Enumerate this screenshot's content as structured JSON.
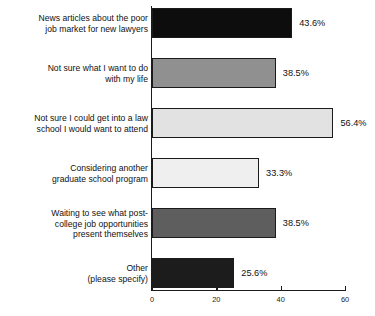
{
  "chart_data": {
    "type": "bar",
    "orientation": "horizontal",
    "title": "",
    "subtitle": "",
    "xlabel": "",
    "ylabel": "",
    "xlim": [
      0,
      60
    ],
    "xticks": [
      0,
      20,
      40,
      60
    ],
    "xtick_labels": [
      "0",
      "20",
      "40",
      "60"
    ],
    "grid": false,
    "legend": false,
    "value_label_suffix": "%",
    "categories": [
      "News articles about the poor job market for new lawyers",
      "Not sure what I want to do with my life",
      "Not sure I could get into a law school I would want to attend",
      "Considering another graduate school program",
      "Waiting to see what post-college job opportunities present themselves",
      "Other (please specify)"
    ],
    "values": [
      43.6,
      38.5,
      56.4,
      33.3,
      38.5,
      25.6
    ],
    "bars": [
      {
        "label_lines": [
          "News articles about the poor",
          "job market for new lawyers"
        ],
        "value": 43.6,
        "value_label": "43.6%",
        "color": "#0d0d0d"
      },
      {
        "label_lines": [
          "Not sure what I want to do",
          "with my life"
        ],
        "value": 38.5,
        "value_label": "38.5%",
        "color": "#909090"
      },
      {
        "label_lines": [
          "Not sure I could get into a law",
          "school I would want to attend"
        ],
        "value": 56.4,
        "value_label": "56.4%",
        "color": "#e2e2e2"
      },
      {
        "label_lines": [
          "Considering another",
          "graduate school program"
        ],
        "value": 33.3,
        "value_label": "33.3%",
        "color": "#efefef"
      },
      {
        "label_lines": [
          "Waiting to see what post-",
          "college job opportunities",
          "present themselves"
        ],
        "value": 38.5,
        "value_label": "38.5%",
        "color": "#5e5e5e"
      },
      {
        "label_lines": [
          "Other",
          "(please specify)"
        ],
        "value": 25.6,
        "value_label": "25.6%",
        "color": "#1c1c1c"
      }
    ],
    "axis_color": "#1b1b1b",
    "text_color": "#111111",
    "background": "#ffffff"
  }
}
